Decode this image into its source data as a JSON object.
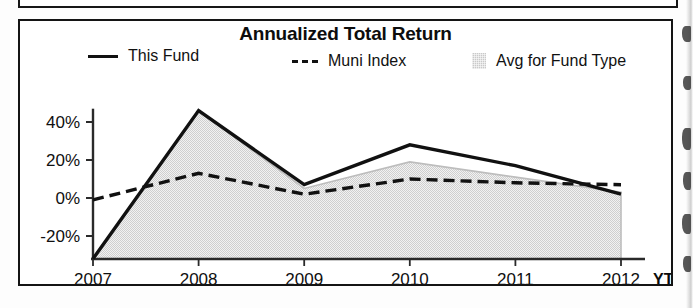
{
  "chart_data": {
    "type": "area",
    "title": "Annualized Total Return",
    "xlabel": "",
    "ylabel": "",
    "categories": [
      "2007",
      "2008",
      "2009",
      "2010",
      "2011",
      "2012"
    ],
    "x_axis_suffix_label": "YTD",
    "ytick_labels": [
      "40%",
      "20%",
      "0%",
      "-20%"
    ],
    "yticks": [
      40,
      20,
      0,
      -20
    ],
    "ylim": [
      -35,
      52
    ],
    "grid": false,
    "legend_position": "top",
    "series": [
      {
        "name": "This Fund",
        "style": "solid-line",
        "color": "#111111",
        "values": [
          -32,
          46,
          7,
          28,
          17,
          2
        ]
      },
      {
        "name": "Muni Index",
        "style": "dashed-line",
        "color": "#111111",
        "values": [
          -1,
          13,
          2,
          10,
          8,
          7
        ]
      },
      {
        "name": "Avg for Fund Type",
        "style": "shaded-area",
        "color": "#c9c9c9",
        "values": [
          -32,
          46,
          5,
          19,
          11,
          3
        ]
      }
    ]
  },
  "chart": {
    "title": "Annualized Total Return",
    "legend": [
      {
        "label": "This Fund",
        "swatch": "solid-line-swatch"
      },
      {
        "label": "Muni Index",
        "swatch": "dashed-line-swatch"
      },
      {
        "label": "Avg for Fund Type",
        "swatch": "shaded-area-swatch"
      }
    ],
    "y_axis": {
      "ticks": [
        "40%",
        "20%",
        "0%",
        "-20%"
      ]
    },
    "x_axis": {
      "ticks": [
        "2007",
        "2008",
        "2009",
        "2010",
        "2011",
        "2012"
      ],
      "trailing_label": "YTD"
    }
  },
  "colors": {
    "line": "#111111",
    "area_fill": "#c9c9c9",
    "frame": "#141414",
    "background": "#ffffff"
  }
}
